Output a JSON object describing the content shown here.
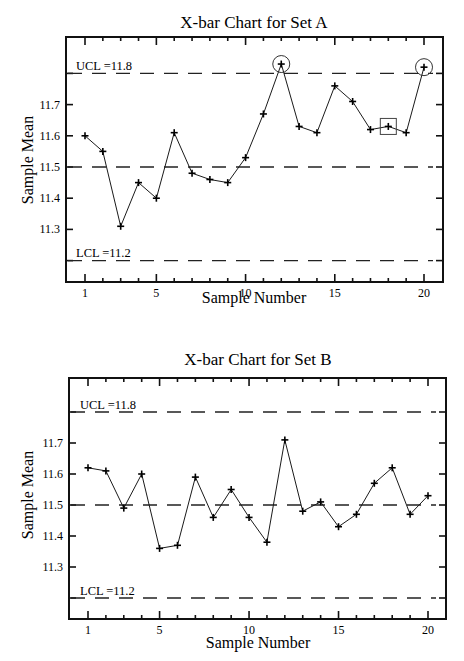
{
  "chart_data": [
    {
      "type": "line",
      "title": "X-bar Chart for Set A",
      "xlabel": "Sample Number",
      "ylabel": "Sample Mean",
      "x": [
        1,
        2,
        3,
        4,
        5,
        6,
        7,
        8,
        9,
        10,
        11,
        12,
        13,
        14,
        15,
        16,
        17,
        18,
        19,
        20
      ],
      "values": [
        11.6,
        11.55,
        11.31,
        11.45,
        11.4,
        11.61,
        11.48,
        11.46,
        11.45,
        11.53,
        11.67,
        11.83,
        11.63,
        11.61,
        11.76,
        11.71,
        11.62,
        11.63,
        11.61,
        11.82
      ],
      "xticks": [
        1,
        5,
        10,
        15,
        20
      ],
      "xtick_labels": [
        "1",
        "5",
        "10",
        "15",
        "20"
      ],
      "yticks": [
        11.3,
        11.4,
        11.5,
        11.6,
        11.7
      ],
      "ytick_labels": [
        "11.3",
        "11.4",
        "11.5",
        "11.6",
        "11.7"
      ],
      "xlim": [
        0,
        21
      ],
      "ylim": [
        11.1,
        11.91
      ],
      "center_line": 11.5,
      "ucl": 11.8,
      "lcl": 11.2,
      "ucl_label": "UCL =11.8",
      "lcl_label": "LCL =11.2",
      "grid": false,
      "annotations": [
        {
          "type": "circle",
          "sample": 12,
          "note": "out of control (above UCL)"
        },
        {
          "type": "circle",
          "sample": 20,
          "note": "out of control (above UCL)"
        },
        {
          "type": "square",
          "sample": 18,
          "note": "flagged pattern"
        }
      ]
    },
    {
      "type": "line",
      "title": "X-bar Chart for Set B",
      "xlabel": "Sample Number",
      "ylabel": "Sample Mean",
      "x": [
        1,
        2,
        3,
        4,
        5,
        6,
        7,
        8,
        9,
        10,
        11,
        12,
        13,
        14,
        15,
        16,
        17,
        18,
        19,
        20
      ],
      "values": [
        11.62,
        11.61,
        11.49,
        11.6,
        11.36,
        11.37,
        11.59,
        11.46,
        11.55,
        11.46,
        11.38,
        11.71,
        11.48,
        11.51,
        11.43,
        11.47,
        11.57,
        11.62,
        11.47,
        11.53
      ],
      "xticks": [
        1,
        5,
        10,
        15,
        20
      ],
      "xtick_labels": [
        "1",
        "5",
        "10",
        "15",
        "20"
      ],
      "yticks": [
        11.3,
        11.4,
        11.5,
        11.6,
        11.7
      ],
      "ytick_labels": [
        "11.3",
        "11.4",
        "11.5",
        "11.6",
        "11.7"
      ],
      "xlim": [
        0,
        21
      ],
      "ylim": [
        11.1,
        11.91
      ],
      "center_line": 11.5,
      "ucl": 11.8,
      "lcl": 11.2,
      "ucl_label": "UCL =11.8",
      "lcl_label": "LCL =11.2",
      "grid": false,
      "annotations": []
    }
  ],
  "charts": {
    "a": {
      "title": "X-bar Chart for Set A",
      "xlabel": "Sample Number",
      "ylabel": "Sample Mean",
      "ucl_label": "UCL =11.8",
      "lcl_label": "LCL =11.2"
    },
    "b": {
      "title": "X-bar Chart for Set B",
      "xlabel": "Sample Number",
      "ylabel": "Sample Mean",
      "ucl_label": "UCL =11.8",
      "lcl_label": "LCL =11.2"
    }
  },
  "style": {
    "line_color": "#1a1a1a",
    "frame_color": "#111111",
    "dash_color": "#222222",
    "background": "#ffffff"
  }
}
